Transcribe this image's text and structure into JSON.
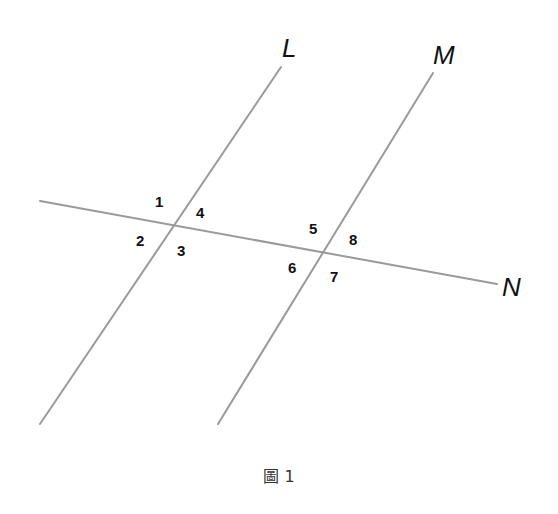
{
  "figure": {
    "caption": "圖 1",
    "lines": [
      {
        "name": "L",
        "x1": 40,
        "y1": 424,
        "x2": 281,
        "y2": 67,
        "label_x": 282,
        "label_y": 57
      },
      {
        "name": "M",
        "x1": 218,
        "y1": 424,
        "x2": 433,
        "y2": 73,
        "label_x": 433,
        "label_y": 64
      },
      {
        "name": "N",
        "x1": 40,
        "y1": 201,
        "x2": 497,
        "y2": 284,
        "label_x": 502,
        "label_y": 296
      }
    ],
    "angles": [
      {
        "label": "1",
        "x": 155,
        "y": 207
      },
      {
        "label": "2",
        "x": 136,
        "y": 246
      },
      {
        "label": "3",
        "x": 177,
        "y": 256
      },
      {
        "label": "4",
        "x": 196,
        "y": 218
      },
      {
        "label": "5",
        "x": 309,
        "y": 234
      },
      {
        "label": "6",
        "x": 288,
        "y": 273
      },
      {
        "label": "7",
        "x": 330,
        "y": 282
      },
      {
        "label": "8",
        "x": 349,
        "y": 245
      }
    ],
    "colors": {
      "line": "#9a9a9a",
      "text": "#111111"
    }
  }
}
